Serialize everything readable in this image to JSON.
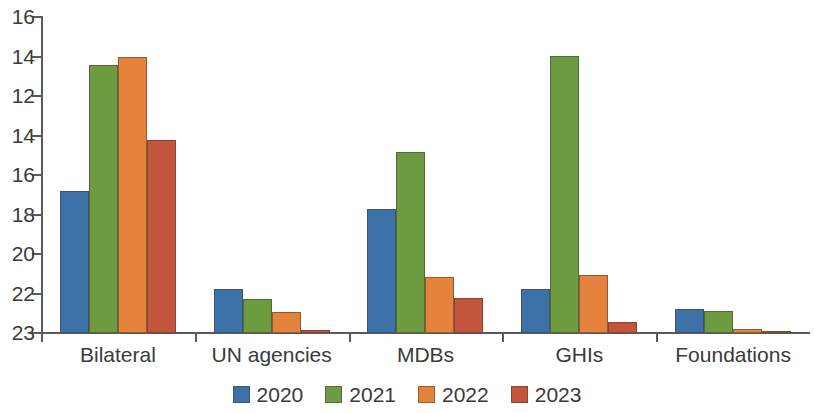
{
  "chart_data": {
    "type": "bar",
    "title": "",
    "subtitle": "",
    "xlabel": "",
    "ylabel": "",
    "grid": false,
    "legend_position": "bottom",
    "categories": [
      "Bilateral",
      "UN agencies",
      "MDBs",
      "GHIs",
      "Foundations"
    ],
    "y_tick_labels": [
      "16",
      "14",
      "12",
      "14",
      "16",
      "18",
      "20",
      "22",
      "23"
    ],
    "y_axis_note": "axis tick labels as printed, top to bottom",
    "series": [
      {
        "name": "2020",
        "color": "#3d72a8",
        "values": [
          9.0,
          2.8,
          7.7,
          2.8,
          1.5
        ],
        "bar_top_px": [
          190,
          288,
          208,
          288,
          308
        ]
      },
      {
        "name": "2021",
        "color": "#6d9b40",
        "values": [
          12.7,
          2.2,
          11.3,
          16.5,
          1.4
        ],
        "bar_top_px": [
          64,
          298,
          151,
          55,
          310
        ]
      },
      {
        "name": "2022",
        "color": "#e5833c",
        "values": [
          13.1,
          1.4,
          3.5,
          3.6,
          0.3
        ],
        "bar_top_px": [
          56,
          311,
          276,
          274,
          328
        ]
      },
      {
        "name": "2023",
        "color": "#c4553d",
        "values": [
          9.2,
          0.3,
          2.2,
          0.7,
          0.2
        ],
        "bar_top_px": [
          139,
          329,
          297,
          321,
          330
        ]
      }
    ],
    "baseline_px": 332,
    "plot_top_px": 16
  },
  "legend": {
    "items": [
      {
        "label": "2020",
        "color": "#3d72a8"
      },
      {
        "label": "2021",
        "color": "#6d9b40"
      },
      {
        "label": "2022",
        "color": "#e5833c"
      },
      {
        "label": "2023",
        "color": "#c4553d"
      }
    ]
  },
  "axis": {
    "y_labels": [
      "16",
      "14",
      "12",
      "14",
      "16",
      "18",
      "20",
      "22",
      "23"
    ],
    "x_labels": [
      "Bilateral",
      "UN agencies",
      "MDBs",
      "GHIs",
      "Foundations"
    ]
  },
  "colors": {
    "series_2020": "#3d72a8",
    "series_2021": "#6d9b40",
    "series_2022": "#e5833c",
    "series_3023": "#c4553d",
    "axis": "#5a5a5a",
    "text": "#3a3a3a",
    "background": "#ffffff"
  }
}
